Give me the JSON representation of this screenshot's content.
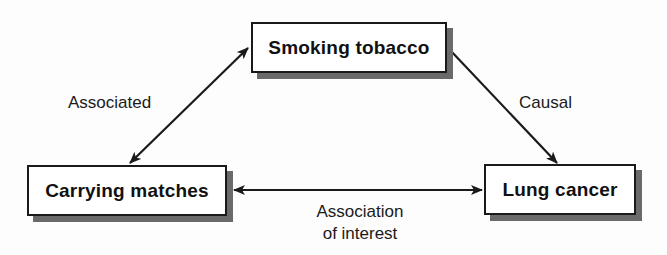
{
  "diagram": {
    "type": "causal-triangle",
    "nodes": [
      {
        "id": "smoking",
        "label": "Smoking tobacco"
      },
      {
        "id": "matches",
        "label": "Carrying matches"
      },
      {
        "id": "cancer",
        "label": "Lung cancer"
      }
    ],
    "edges": [
      {
        "from": "smoking",
        "to": "matches",
        "label": "Associated",
        "direction": "bidirectional"
      },
      {
        "from": "smoking",
        "to": "cancer",
        "label": "Causal",
        "direction": "forward"
      },
      {
        "from": "matches",
        "to": "cancer",
        "label_line1": "Association",
        "label_line2": "of interest",
        "direction": "bidirectional"
      }
    ],
    "colors": {
      "stroke": "#1a1a1a",
      "shadow": "#6a6a6a",
      "background": "#fdfdfd"
    }
  }
}
